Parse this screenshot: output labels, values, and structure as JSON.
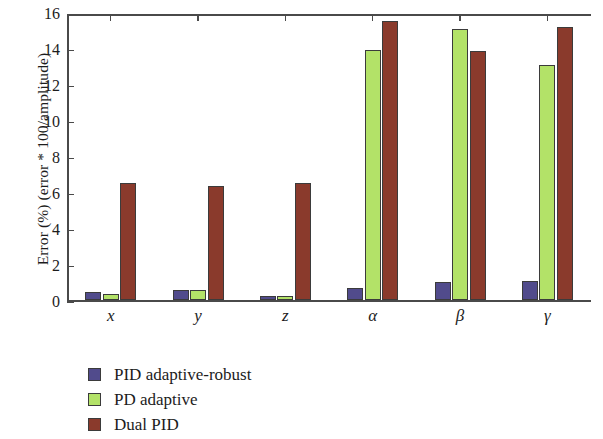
{
  "chart_data": {
    "type": "bar",
    "title": "",
    "xlabel": "",
    "ylabel": "Error (%) (error * 100/amplitude)",
    "categories": [
      "x",
      "y",
      "z",
      "α",
      "β",
      "γ"
    ],
    "ylim": [
      0,
      16
    ],
    "yticks": [
      0,
      2,
      4,
      6,
      8,
      10,
      12,
      14,
      16
    ],
    "ytick_labels": [
      "0",
      "2",
      "4",
      "6",
      "8",
      "10",
      "12",
      "14",
      "16"
    ],
    "grid": false,
    "legend_position": "below-left",
    "series": [
      {
        "name": "PID adaptive-robust",
        "color": "#514b8c",
        "values": [
          0.45,
          0.6,
          0.22,
          0.7,
          1.0,
          1.1
        ]
      },
      {
        "name": "PD adaptive",
        "color": "#b3e268",
        "values": [
          0.38,
          0.6,
          0.22,
          13.9,
          15.1,
          13.1
        ]
      },
      {
        "name": "Dual PID",
        "color": "#8a3a2c",
        "values": [
          6.5,
          6.35,
          6.55,
          15.5,
          13.85,
          15.2
        ]
      }
    ]
  },
  "legend": {
    "items": [
      {
        "label": "PID adaptive-robust",
        "color": "#514b8c"
      },
      {
        "label": "PD adaptive",
        "color": "#b3e268"
      },
      {
        "label": "Dual PID",
        "color": "#8a3a2c"
      }
    ]
  },
  "axes": {
    "line_color": "#4a4a4a"
  }
}
